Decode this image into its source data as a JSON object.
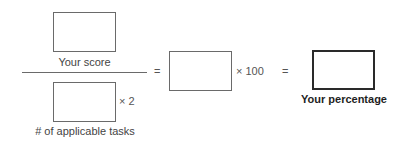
{
  "formula": {
    "numerator": {
      "label": "Your score",
      "value": ""
    },
    "denominator": {
      "label": "# of applicable tasks",
      "value": "",
      "multiplier": "× 2"
    },
    "equals_1": "=",
    "intermediate": {
      "value": "",
      "multiplier": "× 100"
    },
    "equals_2": "=",
    "result": {
      "label": "Your percentage",
      "value": ""
    }
  }
}
